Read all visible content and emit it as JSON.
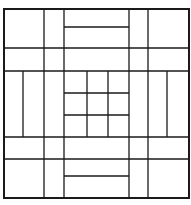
{
  "diagram": {
    "type": "geometric-line-pattern",
    "width": 191,
    "height": 205,
    "stroke_color": "#1a1a1a",
    "background": "#ffffff",
    "border": {
      "x": 4,
      "y": 9,
      "w": 185,
      "h": 189,
      "stroke_width": 2
    },
    "lines": [
      {
        "id": "v-left-1",
        "x1": 44,
        "y1": 9,
        "x2": 44,
        "y2": 198
      },
      {
        "id": "v-left-2",
        "x1": 64,
        "y1": 9,
        "x2": 64,
        "y2": 198
      },
      {
        "id": "v-right-2",
        "x1": 129,
        "y1": 9,
        "x2": 129,
        "y2": 198
      },
      {
        "id": "v-right-1",
        "x1": 148,
        "y1": 9,
        "x2": 148,
        "y2": 198
      },
      {
        "id": "h-top-1",
        "x1": 4,
        "y1": 48,
        "x2": 189,
        "y2": 48
      },
      {
        "id": "h-top-2",
        "x1": 4,
        "y1": 71,
        "x2": 189,
        "y2": 71
      },
      {
        "id": "h-bot-2",
        "x1": 4,
        "y1": 137,
        "x2": 189,
        "y2": 137
      },
      {
        "id": "h-bot-1",
        "x1": 4,
        "y1": 159,
        "x2": 189,
        "y2": 159
      },
      {
        "id": "h-top-mid",
        "x1": 64,
        "y1": 27,
        "x2": 129,
        "y2": 27
      },
      {
        "id": "h-bot-mid",
        "x1": 64,
        "y1": 176,
        "x2": 129,
        "y2": 176
      },
      {
        "id": "v-left-inner",
        "x1": 23,
        "y1": 71,
        "x2": 23,
        "y2": 137
      },
      {
        "id": "v-right-inner",
        "x1": 167,
        "y1": 71,
        "x2": 167,
        "y2": 137
      },
      {
        "id": "v-center-1",
        "x1": 87,
        "y1": 71,
        "x2": 87,
        "y2": 137
      },
      {
        "id": "v-center-2",
        "x1": 108,
        "y1": 71,
        "x2": 108,
        "y2": 137
      },
      {
        "id": "h-center-1",
        "x1": 64,
        "y1": 93,
        "x2": 129,
        "y2": 93
      },
      {
        "id": "h-center-2",
        "x1": 64,
        "y1": 115,
        "x2": 129,
        "y2": 115
      }
    ]
  }
}
